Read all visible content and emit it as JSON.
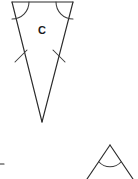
{
  "figure": {
    "background_color": "#ffffff",
    "stroke_color": "#2b2b2b",
    "label_color": "#1a1a1a",
    "main_shape": {
      "name": "isosceles-triangle-C",
      "label": "C",
      "label_x": 42,
      "label_y": 31,
      "apex_x": 42,
      "apex_y": 122,
      "top_left_x": 12,
      "top_left_y": 2,
      "top_right_x": 73,
      "top_right_y": 2,
      "angle_marks": 2,
      "side_tick_marks": 2,
      "top_edge_path": "M 12 2 L 73 2",
      "left_leg_path": "M 12 2 L 42 122",
      "right_leg_path": "M 73 2 L 42 122",
      "left_angle_arc_path": "M 12 19 A 17 17 0 0 0 29 2",
      "right_angle_arc_path": "M 56 2 A 17 17 0 0 0 73 19",
      "left_tick_path": "M 15 62 L 27 50",
      "right_tick_path": "M 53 50 L 65 62"
    },
    "secondary_shape": {
      "name": "partial-triangle-bottom-right",
      "apex_x": 110,
      "apex_y": 145,
      "left_leg_path": "M 110 145 L 87 179",
      "right_leg_path": "M 110 145 L 133 179",
      "angle_arc_path": "M 99 162 A 15 15 0 0 0 121 162",
      "angle_marks": 1
    },
    "edge_fragment": {
      "name": "clipped-figure-fragment-left",
      "path": "M 0 164 L 4 164",
      "x": 0,
      "y": 164
    }
  }
}
